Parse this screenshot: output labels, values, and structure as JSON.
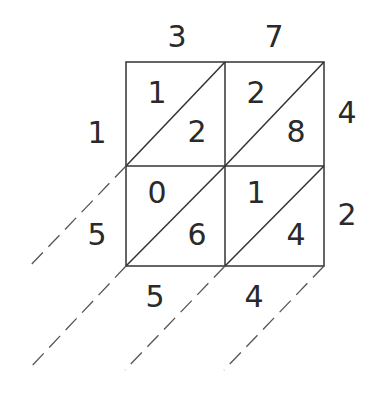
{
  "diagram": {
    "top_digits": [
      "3",
      "7"
    ],
    "right_digits": [
      "4",
      "2"
    ],
    "left_digits": [
      "1",
      "5"
    ],
    "bottom_digits": [
      "5",
      "4"
    ],
    "cells": [
      {
        "row": 0,
        "col": 0,
        "tens": "1",
        "ones": "2"
      },
      {
        "row": 0,
        "col": 1,
        "tens": "2",
        "ones": "8"
      },
      {
        "row": 1,
        "col": 0,
        "tens": "0",
        "ones": "6"
      },
      {
        "row": 1,
        "col": 1,
        "tens": "1",
        "ones": "4"
      }
    ],
    "line_color": "#333333"
  }
}
